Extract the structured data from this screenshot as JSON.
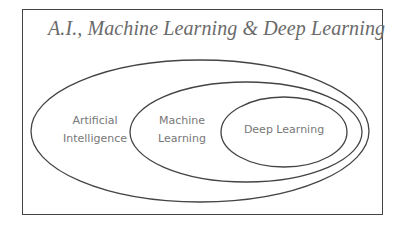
{
  "title": "A.I., Machine Learning & Deep Learning",
  "sets": [
    {
      "id": "ai",
      "label_line1": "Artificial",
      "label_line2": "Intelligence"
    },
    {
      "id": "ml",
      "label_line1": "Machine",
      "label_line2": "Learning"
    },
    {
      "id": "dl",
      "label": "Deep Learning"
    }
  ],
  "colors": {
    "stroke": "#444444",
    "text": "#777777",
    "title": "#6a6a6a"
  }
}
